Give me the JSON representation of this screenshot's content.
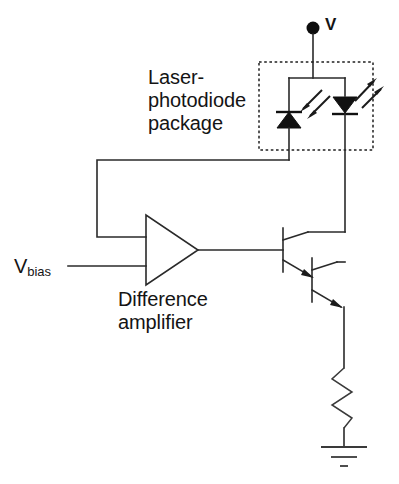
{
  "diagram": {
    "labels": {
      "supply": "V",
      "package_line1": "Laser-",
      "package_line2": "photodiode",
      "package_line3": "package",
      "vbias_main": "V",
      "vbias_sub": "bias",
      "amplifier_line1": "Difference",
      "amplifier_line2": "amplifier"
    },
    "components": {
      "supply_node": "supply-terminal-dot",
      "photodiode": "monitor-photodiode",
      "laser_diode": "laser-diode",
      "package_boundary": "laser-photodiode-package-outline",
      "amplifier": "difference-amplifier-triangle",
      "transistor_1": "npn-transistor-q1",
      "transistor_2": "npn-transistor-q2",
      "resistor": "emitter-resistor",
      "ground": "ground-symbol",
      "feedback_wire": "photodiode-feedback-wire",
      "bias_wire": "vbias-input-wire"
    },
    "colors": {
      "wire": "#2a2a2a",
      "fill": "#111111",
      "background": "#ffffff",
      "text": "#141414"
    }
  }
}
